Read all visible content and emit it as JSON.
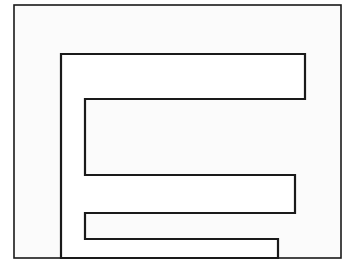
{
  "figure": {
    "background_color": "#ffffff",
    "paper_color": "#fbfbfb",
    "stroke_color": "#1a1a1a",
    "frame": {
      "name": "outer-border",
      "x": 14,
      "y": 5,
      "width": 327,
      "height": 253,
      "stroke_width": 1.6
    },
    "comb": {
      "name": "comb-outline",
      "stroke_width": 2.2,
      "spine_x": 61,
      "spine_top_y": 54,
      "spine_bottom_y": 258,
      "inner_left_x": 85,
      "prongs": [
        {
          "index": 1,
          "top_y": 54,
          "bottom_y": 99,
          "tip_x": 305
        },
        {
          "index": 2,
          "top_y": 99,
          "bottom_y": 175,
          "tip_x": 295
        },
        {
          "index": 3,
          "top_y": 175,
          "bottom_y": 213,
          "tip_x": 278
        },
        {
          "index": 4,
          "top_y": 213,
          "bottom_y": 239,
          "tip_x": 278
        },
        {
          "index": 5,
          "top_y": 239,
          "bottom_y": 258,
          "tip_x": 341
        }
      ],
      "outline_points": "61,54 305,54 305,99 85,99 85,175 295,175 295,213 85,213 85,239 278,239 278,258 61,258 61,54"
    },
    "slot_bands": [
      {
        "name": "slot-1",
        "x": 85,
        "y": 99,
        "width": 220,
        "height": 76
      },
      {
        "name": "slot-2",
        "x": 85,
        "y": 175,
        "width": 210,
        "height": 38
      },
      {
        "name": "slot-3",
        "x": 85,
        "y": 213,
        "width": 193,
        "height": 26
      }
    ]
  }
}
